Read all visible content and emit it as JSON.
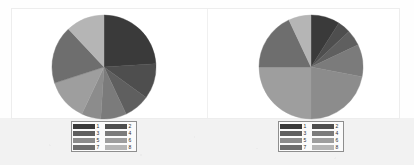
{
  "figure": {
    "background_color": "#fefefe",
    "panel_border_color": "#ededed",
    "lower_band_color": "#f2f2f2"
  },
  "palette": {
    "c1": "#3a3a3a",
    "c2": "#4e4e4e",
    "c3": "#5f5f5f",
    "c4": "#7b7b7b",
    "c5": "#8c8c8c",
    "c6": "#9e9e9e",
    "c7": "#6e6e6e",
    "c8": "#b5b5b5"
  },
  "legend": {
    "border_color": "#8e8e8e",
    "background_color": "#fbfbfb",
    "entries": [
      {
        "label": "1",
        "color": "#3a3a3a"
      },
      {
        "label": "2",
        "color": "#4e4e4e"
      },
      {
        "label": "3",
        "color": "#5f5f5f"
      },
      {
        "label": "4",
        "color": "#7b7b7b"
      },
      {
        "label": "5",
        "color": "#8c8c8c"
      },
      {
        "label": "6",
        "color": "#9e9e9e"
      },
      {
        "label": "7",
        "color": "#6e6e6e"
      },
      {
        "label": "8",
        "color": "#b5b5b5"
      }
    ]
  },
  "chart_data": [
    {
      "type": "pie",
      "id": "left-pie",
      "title": "",
      "start_angle_deg": 0,
      "direction": "clockwise",
      "legend_position": "bottom",
      "categories": [
        "1",
        "2",
        "3",
        "4",
        "5",
        "6",
        "7",
        "8"
      ],
      "values": [
        24,
        11,
        8,
        8,
        6,
        13,
        18,
        12
      ],
      "colors": [
        "#3a3a3a",
        "#4e4e4e",
        "#5f5f5f",
        "#7b7b7b",
        "#8c8c8c",
        "#9e9e9e",
        "#6e6e6e",
        "#b5b5b5"
      ]
    },
    {
      "type": "pie",
      "id": "right-pie",
      "title": "",
      "start_angle_deg": 0,
      "direction": "clockwise",
      "legend_position": "bottom",
      "categories": [
        "1",
        "2",
        "3",
        "4",
        "5",
        "6",
        "7",
        "8"
      ],
      "values": [
        9,
        4,
        5,
        10,
        22,
        25,
        18,
        7
      ],
      "colors": [
        "#3a3a3a",
        "#4e4e4e",
        "#5f5f5f",
        "#7b7b7b",
        "#8c8c8c",
        "#9e9e9e",
        "#6e6e6e",
        "#b5b5b5"
      ]
    }
  ]
}
